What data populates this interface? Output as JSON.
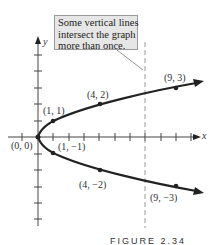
{
  "figure": {
    "callout_lines": [
      "Some vertical lines",
      "intersect the graph",
      "more than once."
    ],
    "axes": {
      "x_label": "x",
      "y_label": "y"
    },
    "points": [
      {
        "label": "(0, 0)",
        "x": 0,
        "y": 0
      },
      {
        "label": "(1, 1)",
        "x": 1,
        "y": 1
      },
      {
        "label": "(4, 2)",
        "x": 4,
        "y": 2
      },
      {
        "label": "(9, 3)",
        "x": 9,
        "y": 3
      },
      {
        "label": "(1, −1)",
        "x": 1,
        "y": -1
      },
      {
        "label": "(4, −2)",
        "x": 4,
        "y": -2
      },
      {
        "label": "(9, −3)",
        "x": 9,
        "y": -3
      }
    ],
    "caption": "FIGURE 2.34",
    "colors": {
      "curve": "#222222",
      "callout_bg": "#e6e6e6",
      "dashed_line": "#999999"
    }
  }
}
